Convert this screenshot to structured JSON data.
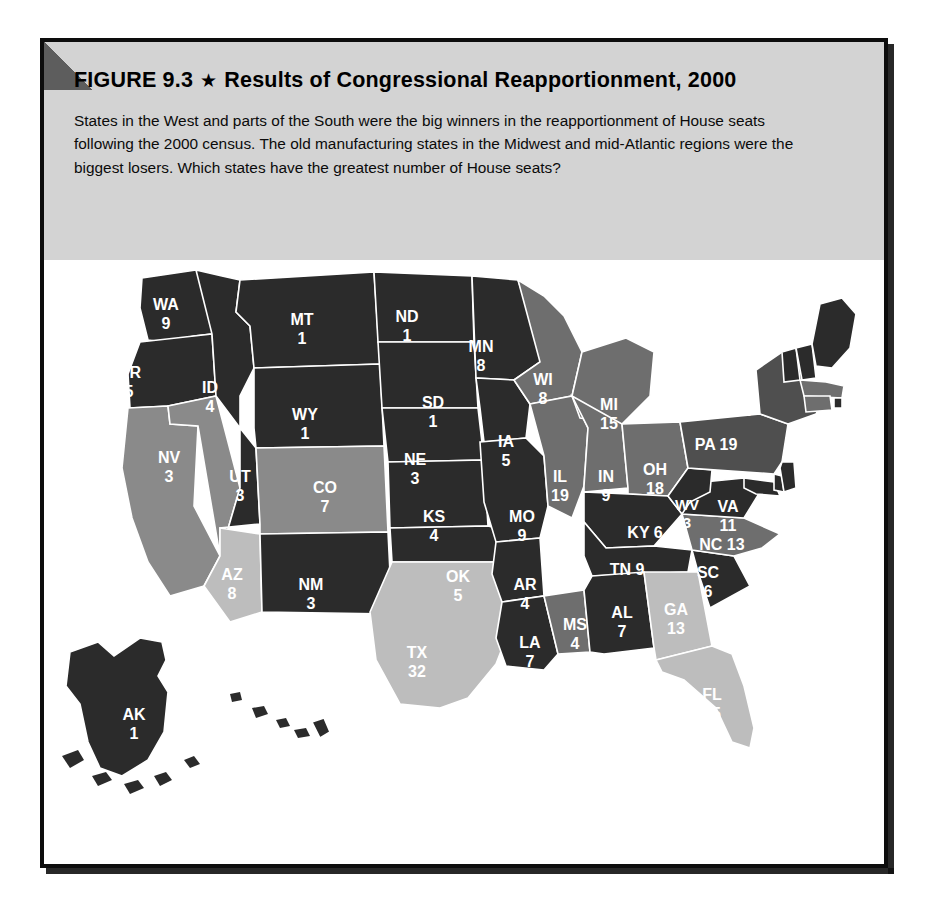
{
  "figure": {
    "title_prefix": "FIGURE 9.3",
    "title_star": "★",
    "title_main": "Results of Congressional Reapportionment, 2000",
    "caption": "States in the West and parts of the South were the big winners in the reapportionment of House seats following the 2000 census. The old manufacturing states in the Midwest and mid-Atlantic regions were the biggest losers. Which states have the greatest number of House seats?"
  },
  "legend": {
    "items": [
      {
        "label": "Gain 2 seats",
        "color": "#bdbdbd",
        "key": "gain2"
      },
      {
        "label": "Gain 1 seat",
        "color": "#8a8a8a",
        "key": "gain1"
      },
      {
        "label": "No change",
        "color": "#2b2b2b",
        "key": "nochange"
      },
      {
        "label": "Lose 2 seats",
        "color": "#4f4f4f",
        "key": "lose2"
      },
      {
        "label": "Lose 1 seat",
        "color": "#6e6e6e",
        "key": "lose1"
      }
    ]
  },
  "chart_data": {
    "type": "map",
    "title": "Results of Congressional Reapportionment, 2000",
    "value_label": "House seats",
    "category_label": "Reapportionment change",
    "categories": [
      "Gain 2 seats",
      "Gain 1 seat",
      "No change",
      "Lose 2 seats",
      "Lose 1 seat"
    ],
    "category_colors": {
      "gain2": "#bdbdbd",
      "gain1": "#8a8a8a",
      "nochange": "#2b2b2b",
      "lose2": "#4f4f4f",
      "lose1": "#6e6e6e"
    },
    "states": [
      {
        "abbr": "WA",
        "seats": 9,
        "cat": "nochange"
      },
      {
        "abbr": "OR",
        "seats": 5,
        "cat": "nochange"
      },
      {
        "abbr": "CA",
        "seats": 53,
        "cat": "gain1"
      },
      {
        "abbr": "NV",
        "seats": 3,
        "cat": "gain1"
      },
      {
        "abbr": "ID",
        "seats": 4,
        "cat": "nochange"
      },
      {
        "abbr": "MT",
        "seats": 1,
        "cat": "nochange"
      },
      {
        "abbr": "WY",
        "seats": 1,
        "cat": "nochange"
      },
      {
        "abbr": "UT",
        "seats": 3,
        "cat": "nochange"
      },
      {
        "abbr": "CO",
        "seats": 7,
        "cat": "gain1"
      },
      {
        "abbr": "AZ",
        "seats": 8,
        "cat": "gain2"
      },
      {
        "abbr": "NM",
        "seats": 3,
        "cat": "nochange"
      },
      {
        "abbr": "ND",
        "seats": 1,
        "cat": "nochange"
      },
      {
        "abbr": "SD",
        "seats": 1,
        "cat": "nochange"
      },
      {
        "abbr": "NE",
        "seats": 3,
        "cat": "nochange"
      },
      {
        "abbr": "KS",
        "seats": 4,
        "cat": "nochange"
      },
      {
        "abbr": "OK",
        "seats": 5,
        "cat": "nochange"
      },
      {
        "abbr": "TX",
        "seats": 32,
        "cat": "gain2"
      },
      {
        "abbr": "MN",
        "seats": 8,
        "cat": "nochange"
      },
      {
        "abbr": "IA",
        "seats": 5,
        "cat": "nochange"
      },
      {
        "abbr": "MO",
        "seats": 9,
        "cat": "nochange"
      },
      {
        "abbr": "AR",
        "seats": 4,
        "cat": "nochange"
      },
      {
        "abbr": "LA",
        "seats": 7,
        "cat": "nochange"
      },
      {
        "abbr": "WI",
        "seats": 8,
        "cat": "lose1"
      },
      {
        "abbr": "IL",
        "seats": 19,
        "cat": "lose1"
      },
      {
        "abbr": "MS",
        "seats": 4,
        "cat": "lose1"
      },
      {
        "abbr": "MI",
        "seats": 15,
        "cat": "lose1"
      },
      {
        "abbr": "IN",
        "seats": 9,
        "cat": "lose1"
      },
      {
        "abbr": "OH",
        "seats": 18,
        "cat": "lose1"
      },
      {
        "abbr": "KY",
        "seats": 6,
        "cat": "nochange"
      },
      {
        "abbr": "TN",
        "seats": 9,
        "cat": "nochange"
      },
      {
        "abbr": "AL",
        "seats": 7,
        "cat": "nochange"
      },
      {
        "abbr": "GA",
        "seats": 13,
        "cat": "gain2"
      },
      {
        "abbr": "FL",
        "seats": 25,
        "cat": "gain2"
      },
      {
        "abbr": "SC",
        "seats": 6,
        "cat": "nochange"
      },
      {
        "abbr": "NC",
        "seats": 13,
        "cat": "lose1"
      },
      {
        "abbr": "VA",
        "seats": 11,
        "cat": "nochange"
      },
      {
        "abbr": "WV",
        "seats": 3,
        "cat": "nochange"
      },
      {
        "abbr": "PA",
        "seats": 19,
        "cat": "lose2"
      },
      {
        "abbr": "NY",
        "seats": 29,
        "cat": "lose2"
      },
      {
        "abbr": "VT",
        "seats": 1,
        "cat": "nochange"
      },
      {
        "abbr": "NH",
        "seats": 2,
        "cat": "nochange"
      },
      {
        "abbr": "ME",
        "seats": 2,
        "cat": "nochange"
      },
      {
        "abbr": "MA",
        "seats": 10,
        "cat": "lose1"
      },
      {
        "abbr": "RI",
        "seats": 2,
        "cat": "nochange"
      },
      {
        "abbr": "CT",
        "seats": 5,
        "cat": "lose1"
      },
      {
        "abbr": "NJ",
        "seats": 13,
        "cat": "nochange"
      },
      {
        "abbr": "DE",
        "seats": 1,
        "cat": "nochange"
      },
      {
        "abbr": "MD",
        "seats": 8,
        "cat": "nochange"
      },
      {
        "abbr": "AK",
        "seats": 1,
        "cat": "nochange"
      },
      {
        "abbr": "HI",
        "seats": 2,
        "cat": "nochange"
      }
    ]
  },
  "map_labels": {
    "inline": [
      {
        "abbr": "WA",
        "seats": "9",
        "x": 122,
        "y": 50,
        "size": 16
      },
      {
        "abbr": "OR",
        "seats": "5",
        "x": 85,
        "y": 118,
        "size": 16
      },
      {
        "abbr": "ID",
        "seats": "4",
        "x": 166,
        "y": 133,
        "size": 16
      },
      {
        "abbr": "MT",
        "seats": "1",
        "x": 258,
        "y": 65,
        "size": 16
      },
      {
        "abbr": "WY",
        "seats": "1",
        "x": 261,
        "y": 160,
        "size": 16
      },
      {
        "abbr": "NV",
        "seats": "3",
        "x": 125,
        "y": 203,
        "size": 16
      },
      {
        "abbr": "UT",
        "seats": "3",
        "x": 196,
        "y": 222,
        "size": 16
      },
      {
        "abbr": "CO",
        "seats": "7",
        "x": 281,
        "y": 233,
        "size": 16
      },
      {
        "abbr": "CA",
        "seats": "53",
        "x": 69,
        "y": 250,
        "size": 16
      },
      {
        "abbr": "AZ",
        "seats": "8",
        "x": 188,
        "y": 320,
        "size": 16
      },
      {
        "abbr": "NM",
        "seats": "3",
        "x": 267,
        "y": 330,
        "size": 16
      },
      {
        "abbr": "ND",
        "seats": "1",
        "x": 363,
        "y": 62,
        "size": 16
      },
      {
        "abbr": "SD",
        "seats": "1",
        "x": 389,
        "y": 148,
        "size": 16
      },
      {
        "abbr": "NE",
        "seats": "3",
        "x": 371,
        "y": 205,
        "size": 16
      },
      {
        "abbr": "KS",
        "seats": "4",
        "x": 390,
        "y": 262,
        "size": 16
      },
      {
        "abbr": "OK",
        "seats": "5",
        "x": 414,
        "y": 322,
        "size": 16
      },
      {
        "abbr": "TX",
        "seats": "32",
        "x": 373,
        "y": 398,
        "size": 16
      },
      {
        "abbr": "MN",
        "seats": "8",
        "x": 437,
        "y": 92,
        "size": 16
      },
      {
        "abbr": "IA",
        "seats": "5",
        "x": 462,
        "y": 187,
        "size": 16
      },
      {
        "abbr": "MO",
        "seats": "9",
        "x": 478,
        "y": 262,
        "size": 16
      },
      {
        "abbr": "AR",
        "seats": "4",
        "x": 481,
        "y": 330,
        "size": 16
      },
      {
        "abbr": "LA",
        "seats": "7",
        "x": 486,
        "y": 388,
        "size": 16
      },
      {
        "abbr": "WI",
        "seats": "8",
        "x": 499,
        "y": 125,
        "size": 16
      },
      {
        "abbr": "IL",
        "seats": "19",
        "x": 516,
        "y": 222,
        "size": 16
      },
      {
        "abbr": "MS",
        "seats": "4",
        "x": 531,
        "y": 370,
        "size": 16
      },
      {
        "abbr": "MI",
        "seats": "15",
        "x": 565,
        "y": 150,
        "size": 16
      },
      {
        "abbr": "IN",
        "seats": "9",
        "x": 562,
        "y": 222,
        "size": 16
      },
      {
        "abbr": "OH",
        "seats": "18",
        "x": 611,
        "y": 215,
        "size": 16
      },
      {
        "abbr": "AL",
        "seats": "7",
        "x": 578,
        "y": 358,
        "size": 16
      },
      {
        "abbr": "GA",
        "seats": "13",
        "x": 632,
        "y": 355,
        "size": 16
      },
      {
        "abbr": "FL",
        "seats": "25",
        "x": 668,
        "y": 440,
        "size": 16
      },
      {
        "abbr": "SC",
        "seats": "6",
        "x": 664,
        "y": 318,
        "size": 16
      },
      {
        "abbr": "WV",
        "seats": "3",
        "x": 643,
        "y": 250,
        "size": 15
      },
      {
        "abbr": "VA",
        "seats": "11",
        "x": 684,
        "y": 252,
        "size": 16
      },
      {
        "abbr": "NY",
        "seats": "29",
        "x": 700,
        "y": 137,
        "size": 16
      },
      {
        "abbr": "AK",
        "seats": "1",
        "x": 90,
        "y": 460,
        "size": 16
      }
    ],
    "inline_wide": [
      {
        "text": "KY 6",
        "x": 601,
        "y": 278,
        "size": 16
      },
      {
        "text": "TN 9",
        "x": 583,
        "y": 315,
        "size": 16
      },
      {
        "text": "PA 19",
        "x": 672,
        "y": 190,
        "size": 16
      },
      {
        "text": "NC 13",
        "x": 678,
        "y": 290,
        "size": 16
      },
      {
        "text": "ME",
        "x": 761,
        "y": 58,
        "size": 16
      },
      {
        "text": "2",
        "x": 761,
        "y": 78,
        "size": 16
      }
    ],
    "outside": [
      {
        "text": "HI",
        "seats": "2",
        "x": 237,
        "y": 494,
        "size": 16
      }
    ],
    "callouts": [
      {
        "text": "NH",
        "sub": "2",
        "left": 731,
        "top": 275,
        "width": 34
      },
      {
        "text": "VT",
        "sub": "1",
        "left": 688,
        "top": 291,
        "width": 34
      },
      {
        "text": "MA 10",
        "left": 829,
        "top": 332
      },
      {
        "text": "RI 2",
        "left": 845,
        "top": 389
      },
      {
        "text": "CT 5",
        "left": 838,
        "top": 417
      },
      {
        "text": "NJ 13",
        "left": 821,
        "top": 443
      },
      {
        "text": "DE 1",
        "left": 830,
        "top": 470
      },
      {
        "text": "MD 8",
        "left": 822,
        "top": 496
      }
    ]
  }
}
